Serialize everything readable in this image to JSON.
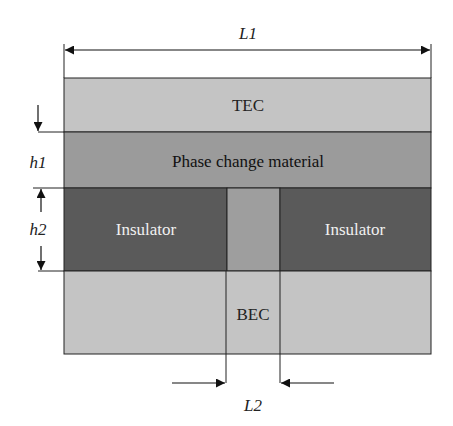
{
  "diagram": {
    "title": "",
    "dimensions": {
      "L1": "L1",
      "L2": "L2",
      "h1": "h1",
      "h2": "h2"
    },
    "layers": [
      {
        "id": "tec",
        "label": "TEC",
        "color": "#c4c4c4",
        "text_color": "#222222"
      },
      {
        "id": "pcm",
        "label": "Phase change material",
        "color": "#9b9b9b",
        "text_color": "#111111"
      },
      {
        "id": "insulator-left",
        "label": "Insulator",
        "color": "#5a5a5a",
        "text_color": "#f0f0f0"
      },
      {
        "id": "pcm-gap",
        "label": "",
        "color": "#9e9e9e"
      },
      {
        "id": "insulator-right",
        "label": "Insulator",
        "color": "#5a5a5a",
        "text_color": "#f0f0f0"
      },
      {
        "id": "bec",
        "label": "BEC",
        "color": "#c4c4c4",
        "text_color": "#222222"
      }
    ]
  }
}
